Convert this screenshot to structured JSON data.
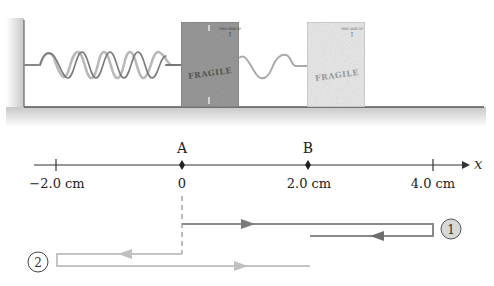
{
  "scene": {
    "wall_color": "#d8d8d8",
    "floor_color": "#d0d0d0",
    "spring_color": "#888888",
    "box_current": {
      "label": "FRAGILE",
      "arrow_label": "THIS SIDE UP",
      "fill": "#9a9a9a"
    },
    "box_extended": {
      "label": "FRAGILE",
      "arrow_label": "THIS SIDE UP",
      "fill": "#e6e6e6"
    }
  },
  "axis": {
    "variable": "x",
    "ticks": [
      {
        "value": -2.0,
        "label": "−2.0 cm"
      },
      {
        "value": 0,
        "label": "0"
      },
      {
        "value": 2.0,
        "label": "2.0 cm"
      },
      {
        "value": 4.0,
        "label": "4.0 cm"
      }
    ],
    "points": [
      {
        "name": "A",
        "value": 0
      },
      {
        "name": "B",
        "value": 2.0
      }
    ]
  },
  "paths": [
    {
      "id": "1",
      "label": "1",
      "color": "#8a8a8a",
      "description": "A → 4.0 cm → back to ~2.0 cm"
    },
    {
      "id": "2",
      "label": "2",
      "color": "#c4c4c4",
      "description": "A → −2.0 cm → back to ~2.0 cm"
    }
  ]
}
